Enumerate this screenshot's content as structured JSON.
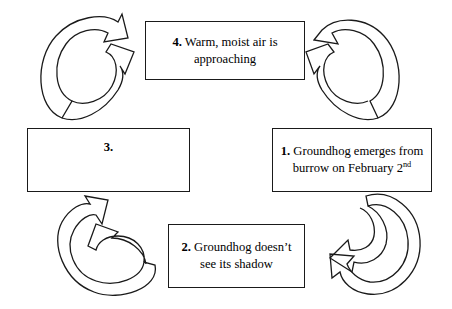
{
  "diagram": {
    "type": "cycle-flowchart",
    "direction": "clockwise",
    "background_color": "#ffffff",
    "stroke_color": "#1a1a1a",
    "boxes": [
      {
        "id": "box-1",
        "step": "1.",
        "text_line_1": "Groundhog emerges",
        "text_line_2": "from burrow on",
        "text_line_3_pre": "February 2",
        "text_line_3_sup": "nd",
        "position": "right"
      },
      {
        "id": "box-2",
        "step": "2.",
        "text_line_1": "Groundhog",
        "text_line_2": "doesn’t see its",
        "text_line_3": "shadow",
        "position": "bottom"
      },
      {
        "id": "box-3",
        "step": "3.",
        "text_line_1": "",
        "position": "left",
        "blank": true
      },
      {
        "id": "box-4",
        "step": "4.",
        "text_line_1": "Warm, moist air is",
        "text_line_2": "approaching",
        "position": "top"
      }
    ],
    "arrows": [
      {
        "id": "arrow-bottom-right",
        "name": "curved-arrow-1-to-2",
        "from": "box-1",
        "to": "box-2"
      },
      {
        "id": "arrow-bottom-left",
        "name": "curved-arrow-2-to-3",
        "from": "box-2",
        "to": "box-3"
      },
      {
        "id": "arrow-top-left",
        "name": "curved-arrow-3-to-4",
        "from": "box-3",
        "to": "box-4"
      },
      {
        "id": "arrow-top-right",
        "name": "curved-arrow-4-to-1",
        "from": "box-4",
        "to": "box-1"
      }
    ]
  }
}
